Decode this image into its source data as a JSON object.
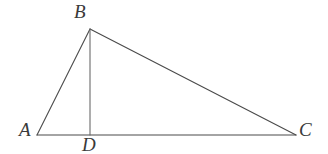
{
  "figure": {
    "kind": "geometry-diagram",
    "width": 328,
    "height": 154,
    "background_color": "#ffffff",
    "stroke_color": "#4a4a4a",
    "label_color": "#3a3a3a",
    "stroke_width": 1.1
  },
  "points": {
    "A": {
      "label": "A",
      "x": 37,
      "y": 135
    },
    "B": {
      "label": "B",
      "x": 90,
      "y": 29
    },
    "C": {
      "label": "C",
      "x": 296,
      "y": 135
    },
    "D": {
      "label": "D",
      "x": 90,
      "y": 135
    }
  },
  "segments": [
    {
      "name": "AB",
      "from": "A",
      "to": "B"
    },
    {
      "name": "BC",
      "from": "B",
      "to": "C"
    },
    {
      "name": "AC",
      "from": "A",
      "to": "C"
    },
    {
      "name": "BD",
      "from": "B",
      "to": "D"
    }
  ]
}
